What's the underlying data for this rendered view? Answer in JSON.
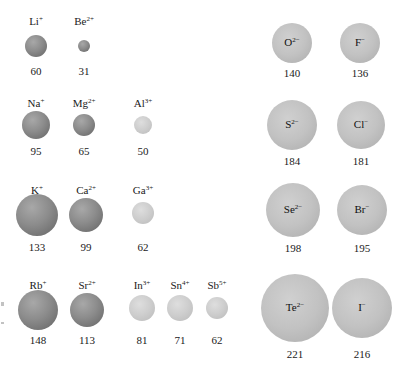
{
  "cations": [
    {
      "symbol": "Li",
      "charge": "+",
      "radius_pm": 60,
      "value": "60",
      "shade": "dark"
    },
    {
      "symbol": "Be",
      "charge": "2+",
      "radius_pm": 31,
      "value": "31",
      "shade": "dark"
    },
    {
      "symbol": "Na",
      "charge": "+",
      "radius_pm": 95,
      "value": "95",
      "shade": "dark"
    },
    {
      "symbol": "Mg",
      "charge": "2+",
      "radius_pm": 65,
      "value": "65",
      "shade": "dark"
    },
    {
      "symbol": "Al",
      "charge": "3+",
      "radius_pm": 50,
      "value": "50",
      "shade": "light"
    },
    {
      "symbol": "K",
      "charge": "+",
      "radius_pm": 133,
      "value": "133",
      "shade": "dark"
    },
    {
      "symbol": "Ca",
      "charge": "2+",
      "radius_pm": 99,
      "value": "99",
      "shade": "dark"
    },
    {
      "symbol": "Ga",
      "charge": "3+",
      "radius_pm": 62,
      "value": "62",
      "shade": "light"
    },
    {
      "symbol": "Rb",
      "charge": "+",
      "radius_pm": 148,
      "value": "148",
      "shade": "dark"
    },
    {
      "symbol": "Sr",
      "charge": "2+",
      "radius_pm": 113,
      "value": "113",
      "shade": "dark"
    },
    {
      "symbol": "In",
      "charge": "3+",
      "radius_pm": 81,
      "value": "81",
      "shade": "light"
    },
    {
      "symbol": "Sn",
      "charge": "4+",
      "radius_pm": 71,
      "value": "71",
      "shade": "light"
    },
    {
      "symbol": "Sb",
      "charge": "5+",
      "radius_pm": 62,
      "value": "62",
      "shade": "light"
    }
  ],
  "anions": [
    {
      "symbol": "O",
      "charge": "2−",
      "radius_pm": 140,
      "value": "140"
    },
    {
      "symbol": "F",
      "charge": "−",
      "radius_pm": 136,
      "value": "136"
    },
    {
      "symbol": "S",
      "charge": "2−",
      "radius_pm": 184,
      "value": "184"
    },
    {
      "symbol": "Cl",
      "charge": "−",
      "radius_pm": 181,
      "value": "181"
    },
    {
      "symbol": "Se",
      "charge": "2−",
      "radius_pm": 198,
      "value": "198"
    },
    {
      "symbol": "Br",
      "charge": "−",
      "radius_pm": 195,
      "value": "195"
    },
    {
      "symbol": "Te",
      "charge": "2−",
      "radius_pm": 221,
      "value": "221"
    },
    {
      "symbol": "I",
      "charge": "−",
      "radius_pm": 216,
      "value": "216"
    }
  ]
}
